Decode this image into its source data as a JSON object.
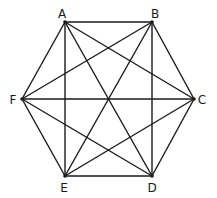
{
  "diagram": {
    "title": "",
    "shape": "regular hexagon with all diagonals",
    "stroke_color": "#1a1a1a",
    "vertices": [
      {
        "label": "A",
        "x": 65,
        "y": 22,
        "lx": 62,
        "ly": 18
      },
      {
        "label": "B",
        "x": 152,
        "y": 22,
        "lx": 155,
        "ly": 18
      },
      {
        "label": "C",
        "x": 194,
        "y": 99,
        "lx": 202,
        "ly": 104
      },
      {
        "label": "D",
        "x": 152,
        "y": 176,
        "lx": 152,
        "ly": 192
      },
      {
        "label": "E",
        "x": 65,
        "y": 176,
        "lx": 64,
        "ly": 192
      },
      {
        "label": "F",
        "x": 22,
        "y": 99,
        "lx": 13,
        "ly": 104
      }
    ],
    "edges": [
      [
        "A",
        "B"
      ],
      [
        "B",
        "C"
      ],
      [
        "C",
        "D"
      ],
      [
        "D",
        "E"
      ],
      [
        "E",
        "F"
      ],
      [
        "F",
        "A"
      ],
      [
        "A",
        "C"
      ],
      [
        "A",
        "D"
      ],
      [
        "A",
        "E"
      ],
      [
        "B",
        "D"
      ],
      [
        "B",
        "E"
      ],
      [
        "B",
        "F"
      ],
      [
        "C",
        "E"
      ],
      [
        "C",
        "F"
      ],
      [
        "D",
        "F"
      ]
    ]
  }
}
